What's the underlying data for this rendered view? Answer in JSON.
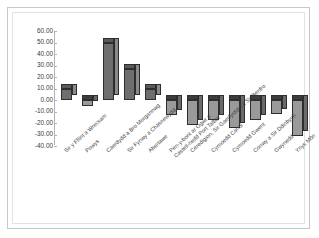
{
  "chart_data": {
    "type": "bar",
    "title": "",
    "subtitle": "",
    "xlabel": "",
    "ylabel": "",
    "ylim": [
      -40,
      60
    ],
    "ytick_step": 10,
    "grid": false,
    "legend": "none",
    "three_d": true,
    "ytick_labels": [
      "60.00",
      "50.00",
      "40.00",
      "30.00",
      "20.00",
      "10.00",
      "0.00",
      "-10.00",
      "-20.00",
      "-30.00",
      "-40.00"
    ],
    "categories": [
      "Sir y Fflint a Wrecsam",
      "Powys",
      "Caerdydd a Bro Morgannwg",
      "Sir Fynwy a Chasnewydd",
      "Abertawe",
      "Pen-y-bont ar Ogwr a\nCastell-nedd Port Talbot",
      "Ceredigion, Sir Gaerfyrddin a Sir Benfro",
      "Cymoedd Canol",
      "Cymoedd Gwent",
      "Conwy a Sir Ddinbych",
      "Gwynedd",
      "Ynys Môn"
    ],
    "values": [
      10,
      -5,
      50,
      27,
      10,
      -13,
      -22,
      -17,
      -24,
      -17,
      -12,
      -31
    ],
    "colors": {
      "bar_front_positive": "#6e6e6e",
      "bar_front_negative": "#9a9a9a",
      "bar_outline": "#2e2e2e",
      "axis": "#b4b4b4",
      "plot_background": "#ffffff",
      "frame_border": "#c8c8c8",
      "text": "#3a3a3a"
    }
  }
}
